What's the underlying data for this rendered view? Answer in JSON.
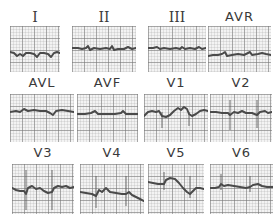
{
  "figure": {
    "leads": [
      {
        "label": "I",
        "roman": true
      },
      {
        "label": "II",
        "roman": true
      },
      {
        "label": "III",
        "roman": true
      },
      {
        "label": "AVR",
        "roman": false
      },
      {
        "label": "AVL",
        "roman": false
      },
      {
        "label": "AVF",
        "roman": false
      },
      {
        "label": "V1",
        "roman": false
      },
      {
        "label": "V2",
        "roman": false
      },
      {
        "label": "V3",
        "roman": false
      },
      {
        "label": "V4",
        "roman": false
      },
      {
        "label": "V5",
        "roman": false
      },
      {
        "label": "V6",
        "roman": false
      }
    ],
    "colors": {
      "trace": "#4a4a4a",
      "grid": "#9a9a9a",
      "paper": "#f3f3f3",
      "label": "#3a3a3a"
    }
  }
}
